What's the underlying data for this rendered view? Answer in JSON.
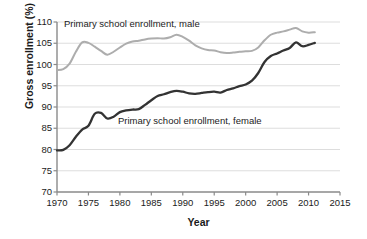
{
  "chart_data": {
    "type": "line",
    "title": "",
    "xlabel": "Year",
    "ylabel": "Gross enrollment (%)",
    "xlim": [
      1970,
      2015
    ],
    "ylim": [
      70,
      110
    ],
    "xticks": [
      1970,
      1975,
      1980,
      1985,
      1990,
      1995,
      2000,
      2005,
      2010,
      2015
    ],
    "yticks": [
      70,
      75,
      80,
      85,
      90,
      95,
      100,
      105,
      110
    ],
    "grid": "horizontal",
    "legend_position": "inline-annotation",
    "annotations": [
      {
        "text": "Primary school enrollment, male",
        "x": 1971,
        "y": 109
      },
      {
        "text": "Primary school enrollment, female",
        "x": 1980,
        "y": 87.5
      }
    ],
    "series": [
      {
        "name": "Primary school enrollment, male",
        "color": "#adadad",
        "x": [
          1970,
          1971,
          1972,
          1973,
          1974,
          1975,
          1976,
          1977,
          1978,
          1979,
          1980,
          1981,
          1982,
          1983,
          1984,
          1985,
          1986,
          1987,
          1988,
          1989,
          1990,
          1991,
          1992,
          1993,
          1994,
          1995,
          1996,
          1997,
          1998,
          1999,
          2000,
          2001,
          2002,
          2003,
          2004,
          2005,
          2006,
          2007,
          2008,
          2009,
          2010,
          2011
        ],
        "y": [
          98.7,
          98.9,
          100.2,
          103.0,
          105.2,
          105.1,
          104.2,
          103.2,
          102.3,
          103.0,
          104.0,
          104.9,
          105.4,
          105.6,
          105.9,
          106.1,
          106.2,
          106.1,
          106.4,
          107.0,
          106.5,
          105.6,
          104.5,
          103.8,
          103.4,
          103.3,
          102.9,
          102.7,
          102.8,
          103.0,
          103.1,
          103.2,
          104.0,
          105.7,
          107.0,
          107.5,
          107.8,
          108.2,
          108.6,
          107.8,
          107.5,
          107.6
        ]
      },
      {
        "name": "Primary school enrollment, female",
        "color": "#333333",
        "x": [
          1970,
          1971,
          1972,
          1973,
          1974,
          1975,
          1976,
          1977,
          1978,
          1979,
          1980,
          1981,
          1982,
          1983,
          1984,
          1985,
          1986,
          1987,
          1988,
          1989,
          1990,
          1991,
          1992,
          1993,
          1994,
          1995,
          1996,
          1997,
          1998,
          1999,
          2000,
          2001,
          2002,
          2003,
          2004,
          2005,
          2006,
          2007,
          2008,
          2009,
          2010,
          2011
        ],
        "y": [
          79.8,
          79.9,
          81.0,
          83.0,
          84.7,
          85.6,
          88.4,
          88.6,
          87.3,
          87.7,
          88.8,
          89.2,
          89.4,
          89.5,
          90.5,
          91.6,
          92.6,
          93.0,
          93.5,
          93.8,
          93.6,
          93.2,
          93.1,
          93.3,
          93.5,
          93.6,
          93.4,
          94.0,
          94.4,
          94.9,
          95.3,
          96.2,
          98.0,
          100.6,
          102.0,
          102.6,
          103.3,
          103.9,
          105.2,
          104.3,
          104.6,
          105.1
        ]
      }
    ]
  },
  "axis": {
    "ylabel": "Gross enrollment (%)",
    "xlabel": "Year",
    "yticks": [
      "110",
      "105",
      "100",
      "95",
      "90",
      "85",
      "80",
      "75",
      "70"
    ],
    "xticks": [
      "1970",
      "1975",
      "1980",
      "1985",
      "1990",
      "1995",
      "2000",
      "2005",
      "2010",
      "2015"
    ]
  },
  "notes": {
    "male": "Primary school enrollment, male",
    "female": "Primary school enrollment, female"
  },
  "colors": {
    "male_line": "#adadad",
    "female_line": "#333333",
    "grid": "#d9d9d9",
    "axis": "#8a8a8a",
    "text": "#1b1b1b"
  }
}
